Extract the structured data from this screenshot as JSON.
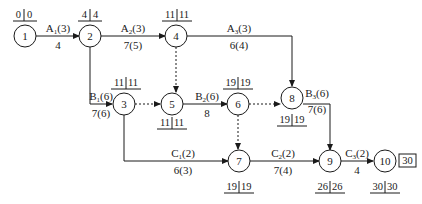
{
  "diagram": {
    "type": "activity-on-arrow network (time-scaled project schedule)",
    "nodes": [
      {
        "id": "1",
        "label": "1",
        "et": "0",
        "lt": "0",
        "time_pos": "above"
      },
      {
        "id": "2",
        "label": "2",
        "et": "4",
        "lt": "4",
        "time_pos": "above"
      },
      {
        "id": "3",
        "label": "3",
        "et": "11",
        "lt": "11",
        "time_pos": "above"
      },
      {
        "id": "4",
        "label": "4",
        "et": "11",
        "lt": "11",
        "time_pos": "above"
      },
      {
        "id": "5",
        "label": "5",
        "et": "11",
        "lt": "11",
        "time_pos": "below"
      },
      {
        "id": "6",
        "label": "6",
        "et": "19",
        "lt": "19",
        "time_pos": "above"
      },
      {
        "id": "7",
        "label": "7",
        "et": "19",
        "lt": "19",
        "time_pos": "below"
      },
      {
        "id": "8",
        "label": "8",
        "et": "19",
        "lt": "19",
        "time_pos": "below"
      },
      {
        "id": "9",
        "label": "9",
        "et": "26",
        "lt": "26",
        "time_pos": "below"
      },
      {
        "id": "10",
        "label": "10",
        "et": "30",
        "lt": "30",
        "time_pos": "below"
      }
    ],
    "activities": [
      {
        "from": "1",
        "to": "2",
        "name": "A",
        "sub": "1",
        "resource": "(3)",
        "duration": "4",
        "dashed": false
      },
      {
        "from": "2",
        "to": "4",
        "name": "A",
        "sub": "2",
        "resource": "(3)",
        "duration": "7(5)",
        "dashed": false
      },
      {
        "from": "4",
        "to": "8",
        "name": "A",
        "sub": "3",
        "resource": "(3)",
        "duration": "6(4)",
        "dashed": false
      },
      {
        "from": "2",
        "to": "3",
        "name": "B",
        "sub": "1",
        "resource": "(6)",
        "duration": "7(6)",
        "dashed": false
      },
      {
        "from": "5",
        "to": "6",
        "name": "B",
        "sub": "2",
        "resource": "(6)",
        "duration": "8",
        "dashed": false
      },
      {
        "from": "8",
        "to": "9",
        "name": "B",
        "sub": "3",
        "resource": "(6)",
        "duration": "7(6)",
        "dashed": false
      },
      {
        "from": "3",
        "to": "7",
        "name": "C",
        "sub": "1",
        "resource": "(2)",
        "duration": "6(3)",
        "dashed": false
      },
      {
        "from": "7",
        "to": "9",
        "name": "C",
        "sub": "2",
        "resource": "(2)",
        "duration": "7(4)",
        "dashed": false
      },
      {
        "from": "9",
        "to": "10",
        "name": "C",
        "sub": "3",
        "resource": "(2)",
        "duration": "4",
        "dashed": false
      },
      {
        "from": "3",
        "to": "5",
        "dashed": true
      },
      {
        "from": "4",
        "to": "5",
        "dashed": true
      },
      {
        "from": "6",
        "to": "8",
        "dashed": true
      },
      {
        "from": "6",
        "to": "7",
        "dashed": true
      }
    ],
    "total_duration": "30"
  },
  "labels": {
    "n1": "1",
    "n2": "2",
    "n3": "3",
    "n4": "4",
    "n5": "5",
    "n6": "6",
    "n7": "7",
    "n8": "8",
    "n9": "9",
    "n10": "10",
    "t1a": "0",
    "t1b": "0",
    "t2a": "4",
    "t2b": "4",
    "t3a": "11",
    "t3b": "11",
    "t4a": "11",
    "t4b": "11",
    "t5a": "11",
    "t5b": "11",
    "t6a": "19",
    "t6b": "19",
    "t7a": "19",
    "t7b": "19",
    "t8a": "19",
    "t8b": "19",
    "t9a": "26",
    "t9b": "26",
    "t10a": "30",
    "t10b": "30",
    "a1_name": "A",
    "a1_sub": "1",
    "a1_res": "(3)",
    "a1_dur": "4",
    "a2_name": "A",
    "a2_sub": "2",
    "a2_res": "(3)",
    "a2_dur": "7(5)",
    "a3_name": "A",
    "a3_sub": "3",
    "a3_res": "(3)",
    "a3_dur": "6(4)",
    "b1_name": "B",
    "b1_sub": "1",
    "b1_res": "(6)",
    "b1_dur": "7(6)",
    "b2_name": "B",
    "b2_sub": "2",
    "b2_res": "(6)",
    "b2_dur": "8",
    "b3_name": "B",
    "b3_sub": "3",
    "b3_res": "(6)",
    "b3_dur": "7(6)",
    "c1_name": "C",
    "c1_sub": "1",
    "c1_res": "(2)",
    "c1_dur": "6(3)",
    "c2_name": "C",
    "c2_sub": "2",
    "c2_res": "(2)",
    "c2_dur": "7(4)",
    "c3_name": "C",
    "c3_sub": "3",
    "c3_res": "(2)",
    "c3_dur": "4",
    "total": "30"
  }
}
